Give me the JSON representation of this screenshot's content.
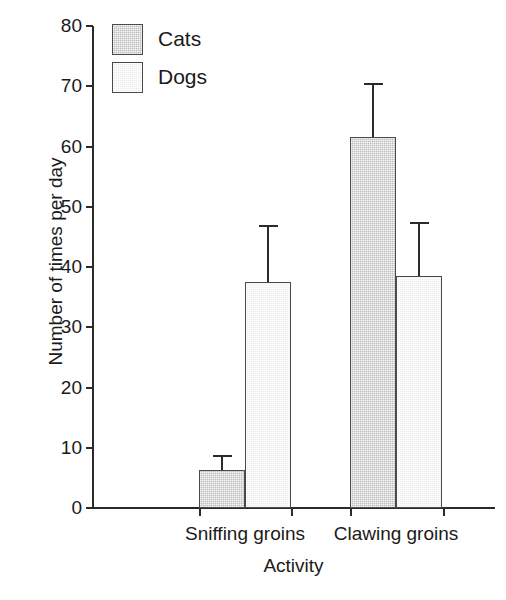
{
  "chart_data": {
    "type": "bar",
    "title": "",
    "xlabel": "Activity",
    "ylabel": "Number of times per day",
    "categories": [
      "Sniffing groins",
      "Clawing groins"
    ],
    "series": [
      {
        "name": "Cats",
        "color": "#bdbdbd",
        "values": [
          6.3,
          61.5
        ],
        "errors_upper": [
          8.8,
          70.5
        ]
      },
      {
        "name": "Dogs",
        "color": "#eeeeee",
        "values": [
          37.5,
          38.5
        ],
        "errors_upper": [
          47.0,
          47.5
        ]
      }
    ],
    "ylim": [
      0,
      80
    ],
    "ytick_step": 10,
    "yticks": [
      "0",
      "10",
      "20",
      "30",
      "40",
      "50",
      "60",
      "70",
      "80"
    ],
    "grid": false,
    "legend_position": "top-left",
    "error_bars": "upper-only"
  },
  "legend": {
    "entries": [
      {
        "label": "Cats"
      },
      {
        "label": "Dogs"
      }
    ]
  }
}
